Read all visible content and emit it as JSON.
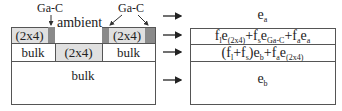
{
  "left_diagram": {
    "annotations": {
      "gac_left": "Ga-C",
      "gac_right": "Ga-C",
      "ambient": "ambient"
    },
    "row1": {
      "left_cell": "(2x4)",
      "right_cell": "(2x4)"
    },
    "row2": {
      "left_cell": "bulk",
      "middle_cell": "(2x4)",
      "right_cell": "bulk"
    },
    "row3": {
      "cell": "bulk"
    }
  },
  "right_diagram": {
    "rows": [
      {
        "base": "e",
        "sub": "a"
      },
      {
        "formula": [
          {
            "t": "f",
            "s": "l"
          },
          {
            "t": "e",
            "s": "(2x4)"
          },
          {
            "t": "+f",
            "s": "s"
          },
          {
            "t": "e",
            "s": "Ga-C"
          },
          {
            "t": "+f",
            "s": "a"
          },
          {
            "t": "e",
            "s": "a"
          }
        ]
      },
      {
        "formula": [
          {
            "t": "(f",
            "s": "l"
          },
          {
            "t": "+f",
            "s": "s"
          },
          {
            "t": ")e",
            "s": "b"
          },
          {
            "t": "+f",
            "s": "a"
          },
          {
            "t": "e",
            "s": "(2x4)"
          }
        ]
      },
      {
        "base": "e",
        "sub": "b"
      }
    ]
  },
  "text": {
    "r0_base": "e",
    "r0_sub": "a",
    "r1": [
      "f",
      "l",
      "e",
      "(2x4)",
      "+f",
      "s",
      "e",
      "Ga-C",
      "+f",
      "a",
      "e",
      "a"
    ],
    "r2": [
      "(f",
      "l",
      "+f",
      "s",
      ")e",
      "b",
      "+f",
      "a",
      "e",
      "(2x4)"
    ],
    "r3_base": "e",
    "r3_sub": "b"
  },
  "colors": {
    "light_fill": "#e0e0e0",
    "dark_fill": "#8a8a8a",
    "line": "#555555"
  }
}
